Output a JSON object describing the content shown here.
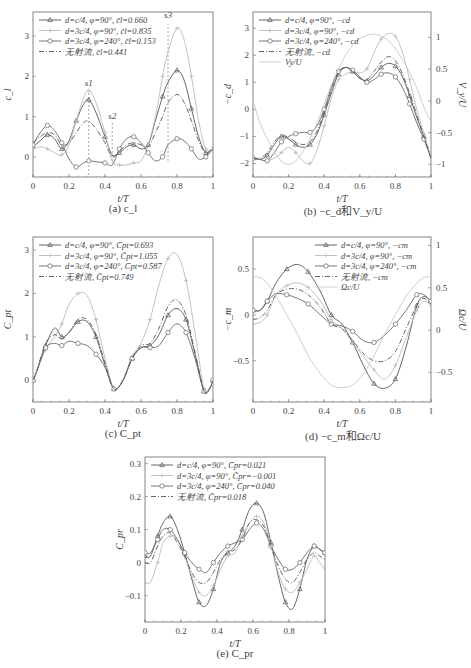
{
  "figure": {
    "captions": [
      "(a) c_l",
      "(b) −c_d和V_y/U",
      "(c) C_pt",
      "(d) −c_m和Ωc/U",
      "(e) C_pr"
    ]
  },
  "styles": {
    "A": {
      "color": "#555555",
      "dash": "",
      "marker": "triangle"
    },
    "B": {
      "color": "#bbbbbb",
      "dash": "",
      "marker": "plus"
    },
    "C": {
      "color": "#666666",
      "dash": "",
      "marker": "circle"
    },
    "D": {
      "color": "#555555",
      "dash": "5,2,1,2",
      "marker": "none"
    },
    "E": {
      "color": "#c8c8c8",
      "dash": "",
      "marker": "none"
    }
  },
  "chart_data": [
    {
      "id": "a",
      "type": "line",
      "caption": "(a) c_l",
      "box": {
        "x": 33,
        "y": 12,
        "w": 180,
        "h": 68
      },
      "xlabel": "t/T",
      "ylabel": "c_l",
      "xlim": [
        0,
        1
      ],
      "ylim": [
        -0.5,
        3.6
      ],
      "xticks": [
        0,
        0.2,
        0.4,
        0.6,
        0.8,
        1
      ],
      "yticks": [
        0,
        1,
        2,
        3
      ],
      "annotations": [
        {
          "text": "s1",
          "x": 0.31,
          "y": 1.75
        },
        {
          "text": "s2",
          "x": 0.44,
          "y": 0.95
        },
        {
          "text": "s3",
          "x": 0.75,
          "y": 3.45
        }
      ],
      "vlines": [
        {
          "x": 0.31,
          "y0": -0.45,
          "y1": 1.6
        },
        {
          "x": 0.44,
          "y0": -0.1,
          "y1": 0.85
        },
        {
          "x": 0.75,
          "y0": -0.1,
          "y1": 3.3
        }
      ],
      "legend": [
        {
          "style": "A",
          "label": "d=c/4, φ=90°, c̄l=0.660"
        },
        {
          "style": "B",
          "label": "d=3c/4, φ=90°, c̄l=0.835"
        },
        {
          "style": "C",
          "label": "d=3c/4, φ=240°, c̄l=0.153"
        },
        {
          "style": "D",
          "label": "无射流, c̄l=0.441"
        }
      ],
      "x": [
        0,
        0.04,
        0.08,
        0.12,
        0.16,
        0.2,
        0.24,
        0.28,
        0.31,
        0.35,
        0.4,
        0.44,
        0.48,
        0.52,
        0.56,
        0.6,
        0.64,
        0.68,
        0.72,
        0.75,
        0.8,
        0.84,
        0.88,
        0.92,
        0.96,
        1.0
      ],
      "series": [
        {
          "name": "d=c/4, φ=90°",
          "style": "A",
          "values": [
            0.25,
            0.4,
            0.55,
            0.45,
            0.2,
            0.4,
            0.9,
            1.3,
            1.42,
            1.1,
            0.5,
            0.05,
            0.1,
            0.25,
            0.3,
            0.2,
            0.3,
            0.9,
            1.5,
            1.85,
            2.15,
            1.9,
            1.2,
            0.5,
            0.1,
            0.2
          ]
        },
        {
          "name": "d=3c/4, φ=90°",
          "style": "B",
          "values": [
            0.2,
            0.25,
            0.2,
            0.1,
            0.05,
            0.3,
            0.9,
            1.45,
            1.65,
            1.35,
            0.6,
            -0.1,
            -0.2,
            -0.2,
            -0.15,
            -0.1,
            0.3,
            1.0,
            2.0,
            2.6,
            3.2,
            2.9,
            2.0,
            0.9,
            0.2,
            0.2
          ]
        },
        {
          "name": "d=3c/4, φ=240°",
          "style": "C",
          "values": [
            0.3,
            0.6,
            0.78,
            0.65,
            0.35,
            -0.05,
            -0.25,
            -0.15,
            -0.1,
            -0.12,
            -0.15,
            -0.2,
            0.2,
            0.45,
            0.5,
            0.35,
            0.1,
            -0.1,
            0.0,
            0.3,
            0.45,
            0.4,
            0.2,
            -0.05,
            0.0,
            0.2
          ]
        },
        {
          "name": "无射流",
          "style": "D",
          "values": [
            0.35,
            0.5,
            0.6,
            0.55,
            0.3,
            0.35,
            0.6,
            0.85,
            0.88,
            0.7,
            0.35,
            0.0,
            0.15,
            0.3,
            0.35,
            0.3,
            0.25,
            0.6,
            1.0,
            1.35,
            1.55,
            1.35,
            0.9,
            0.4,
            0.1,
            0.25
          ]
        }
      ]
    },
    {
      "id": "b",
      "type": "line",
      "caption": "(b) −c_d和V_y/U",
      "box": {
        "x": 253,
        "y": 12,
        "w": 178,
        "h": 68
      },
      "xlabel": "t/T",
      "ylabel": "−c_d",
      "y2label": "V_y/U",
      "xlim": [
        0,
        1
      ],
      "ylim": [
        -2.5,
        3.6
      ],
      "y2lim": [
        -1.2,
        1.4
      ],
      "xticks": [
        0,
        0.2,
        0.4,
        0.6,
        0.8,
        1
      ],
      "yticks": [
        -2,
        -1,
        0,
        1,
        2,
        3
      ],
      "y2ticks": [
        -1,
        -0.5,
        0,
        0.5,
        1
      ],
      "legend": [
        {
          "style": "A",
          "label": "d=c/4, φ=90°, −cd"
        },
        {
          "style": "B",
          "label": "d=3c/4, φ=90°, −cd"
        },
        {
          "style": "C",
          "label": "d=3c/4, φ=240°, −cd"
        },
        {
          "style": "D",
          "label": "无射流, −cd"
        },
        {
          "style": "E",
          "label": "Vy/U"
        }
      ],
      "x": [
        0,
        0.04,
        0.08,
        0.12,
        0.16,
        0.2,
        0.24,
        0.28,
        0.32,
        0.36,
        0.4,
        0.44,
        0.48,
        0.52,
        0.56,
        0.6,
        0.64,
        0.68,
        0.72,
        0.76,
        0.8,
        0.84,
        0.88,
        0.92,
        0.96,
        1.0
      ],
      "series": [
        {
          "name": "d=c/4, φ=90°",
          "style": "A",
          "values": [
            -1.8,
            -1.85,
            -1.7,
            -1.3,
            -1.0,
            -1.1,
            -1.3,
            -1.4,
            -1.3,
            -0.9,
            -0.2,
            0.6,
            1.3,
            1.55,
            1.4,
            1.15,
            1.05,
            1.25,
            1.55,
            1.7,
            1.6,
            1.2,
            0.5,
            -0.3,
            -1.0,
            -1.8
          ]
        },
        {
          "name": "d=3c/4, φ=90°",
          "style": "B",
          "values": [
            -1.8,
            -1.85,
            -1.9,
            -1.8,
            -1.6,
            -1.4,
            -1.6,
            -1.9,
            -2.0,
            -1.5,
            -0.6,
            0.4,
            1.1,
            1.3,
            1.4,
            1.35,
            1.5,
            2.1,
            2.6,
            2.8,
            2.7,
            2.1,
            1.1,
            0.0,
            -0.9,
            -1.8
          ]
        },
        {
          "name": "d=3c/4, φ=240°",
          "style": "C",
          "values": [
            -1.8,
            -1.85,
            -1.9,
            -1.6,
            -1.2,
            -1.0,
            -0.9,
            -0.85,
            -0.85,
            -0.6,
            0.0,
            0.8,
            1.4,
            1.55,
            1.45,
            1.2,
            1.0,
            1.1,
            1.3,
            1.35,
            1.2,
            0.8,
            0.2,
            -0.5,
            -1.1,
            -1.8
          ]
        },
        {
          "name": "无射流",
          "style": "D",
          "values": [
            -1.8,
            -1.8,
            -1.6,
            -1.2,
            -0.95,
            -1.05,
            -1.2,
            -1.3,
            -1.2,
            -0.8,
            -0.1,
            0.7,
            1.35,
            1.55,
            1.4,
            1.15,
            1.1,
            1.4,
            1.75,
            1.95,
            1.8,
            1.3,
            0.6,
            -0.2,
            -1.0,
            -1.8
          ]
        },
        {
          "name": "Vy/U",
          "style": "E",
          "axis": "y2",
          "values": [
            0.0,
            -0.35,
            -0.6,
            -0.8,
            -0.95,
            -1.0,
            -0.95,
            -0.8,
            -0.6,
            -0.35,
            -0.05,
            0.25,
            0.5,
            0.72,
            0.88,
            0.98,
            1.03,
            1.05,
            1.02,
            0.95,
            0.82,
            0.65,
            0.45,
            0.2,
            -0.1,
            -0.35
          ]
        }
      ]
    },
    {
      "id": "c",
      "type": "line",
      "caption": "(c) C_pt",
      "box": {
        "x": 33,
        "y": 237,
        "w": 180,
        "h": 68
      },
      "xlabel": "t/T",
      "ylabel": "C_pt",
      "xlim": [
        0,
        1
      ],
      "ylim": [
        -0.5,
        3.3
      ],
      "xticks": [
        0,
        0.2,
        0.4,
        0.6,
        0.8,
        1
      ],
      "yticks": [
        0,
        1,
        2,
        3
      ],
      "legend": [
        {
          "style": "A",
          "label": "d=c/4, φ=90°, C̄pt=0.693"
        },
        {
          "style": "B",
          "label": "d=3c/4, φ=90°, C̄pt=1.055"
        },
        {
          "style": "C",
          "label": "d=3c/4, φ=240°, C̄pt=0.587"
        },
        {
          "style": "D",
          "label": "无射流, C̄pt=0.749"
        }
      ],
      "x": [
        0,
        0.02,
        0.07,
        0.12,
        0.16,
        0.2,
        0.25,
        0.3,
        0.35,
        0.4,
        0.45,
        0.5,
        0.55,
        0.6,
        0.65,
        0.7,
        0.75,
        0.8,
        0.85,
        0.9,
        0.95,
        0.98,
        1.0
      ],
      "series": [
        {
          "name": "d=c/4, φ=90°",
          "style": "A",
          "values": [
            0.0,
            0.2,
            0.8,
            1.2,
            1.0,
            1.1,
            1.35,
            1.35,
            1.0,
            0.35,
            -0.2,
            0.0,
            0.5,
            0.75,
            0.8,
            1.05,
            1.5,
            1.65,
            1.4,
            0.6,
            -0.25,
            -0.2,
            0.0
          ]
        },
        {
          "name": "d=3c/4, φ=90°",
          "style": "B",
          "values": [
            0.0,
            0.2,
            0.7,
            1.0,
            1.3,
            1.75,
            2.0,
            1.95,
            1.4,
            0.5,
            -0.2,
            0.0,
            0.55,
            0.85,
            1.4,
            2.2,
            2.8,
            2.9,
            2.3,
            1.1,
            -0.2,
            -0.2,
            0.0
          ]
        },
        {
          "name": "d=3c/4, φ=240°",
          "style": "C",
          "values": [
            0.0,
            0.2,
            0.75,
            0.85,
            0.8,
            0.9,
            0.85,
            0.8,
            0.6,
            0.3,
            -0.2,
            0.0,
            0.5,
            0.75,
            0.75,
            0.8,
            1.1,
            1.3,
            1.1,
            0.5,
            -0.25,
            -0.2,
            0.0
          ]
        },
        {
          "name": "无射流",
          "style": "D",
          "values": [
            0.0,
            0.2,
            0.85,
            1.05,
            0.95,
            1.1,
            1.4,
            1.4,
            1.05,
            0.4,
            -0.2,
            0.0,
            0.5,
            0.8,
            0.85,
            1.2,
            1.7,
            1.85,
            1.5,
            0.65,
            -0.25,
            -0.2,
            0.0
          ]
        }
      ]
    },
    {
      "id": "d",
      "type": "line",
      "caption": "(d) −c_m和Ωc/U",
      "box": {
        "x": 253,
        "y": 237,
        "w": 178,
        "h": 68
      },
      "xlabel": "t/T",
      "ylabel": "−c_m",
      "y2label": "Ωc/U",
      "xlim": [
        0,
        1
      ],
      "ylim": [
        -0.95,
        0.85
      ],
      "y2lim": [
        -0.85,
        1.1
      ],
      "xticks": [
        0,
        0.2,
        0.4,
        0.6,
        0.8,
        1
      ],
      "yticks": [
        -0.5,
        0,
        0.5
      ],
      "y2ticks": [
        -0.5,
        0,
        0.5,
        1
      ],
      "legend": [
        {
          "style": "A",
          "label": "d=c/4, φ=90°, −cm"
        },
        {
          "style": "B",
          "label": "d=3c/4, φ=90°, −cm"
        },
        {
          "style": "C",
          "label": "d=3c/4, φ=240°, −cm"
        },
        {
          "style": "D",
          "label": "无射流, −cm"
        },
        {
          "style": "E",
          "label": "Ωc/U"
        }
      ],
      "x": [
        0,
        0.04,
        0.08,
        0.13,
        0.19,
        0.25,
        0.31,
        0.38,
        0.44,
        0.5,
        0.56,
        0.62,
        0.68,
        0.74,
        0.8,
        0.86,
        0.92,
        0.96,
        1.0
      ],
      "series": [
        {
          "name": "d=c/4, φ=90°",
          "style": "A",
          "values": [
            0.05,
            0.05,
            0.15,
            0.35,
            0.5,
            0.55,
            0.47,
            0.25,
            0.0,
            -0.1,
            -0.3,
            -0.55,
            -0.75,
            -0.8,
            -0.7,
            -0.35,
            0.1,
            0.2,
            0.15
          ]
        },
        {
          "name": "d=3c/4, φ=90°",
          "style": "B",
          "values": [
            -0.1,
            -0.08,
            0.0,
            0.22,
            0.32,
            0.35,
            0.3,
            0.15,
            -0.05,
            -0.15,
            -0.3,
            -0.45,
            -0.6,
            -0.7,
            -0.55,
            -0.25,
            0.05,
            0.15,
            0.1
          ]
        },
        {
          "name": "d=3c/4, φ=240°",
          "style": "C",
          "values": [
            0.05,
            0.05,
            0.15,
            0.23,
            0.22,
            0.18,
            0.12,
            0.0,
            -0.1,
            -0.12,
            -0.18,
            -0.28,
            -0.3,
            -0.22,
            -0.1,
            0.05,
            0.22,
            0.22,
            0.15
          ]
        },
        {
          "name": "无射流",
          "style": "D",
          "values": [
            -0.05,
            -0.03,
            0.05,
            0.22,
            0.28,
            0.28,
            0.22,
            0.08,
            -0.1,
            -0.15,
            -0.28,
            -0.42,
            -0.5,
            -0.5,
            -0.4,
            -0.15,
            0.1,
            0.18,
            0.12
          ]
        },
        {
          "name": "Ωc/U",
          "style": "E",
          "axis": "y2",
          "values": [
            0.63,
            0.62,
            0.55,
            0.4,
            0.18,
            -0.05,
            -0.3,
            -0.52,
            -0.65,
            -0.68,
            -0.65,
            -0.52,
            -0.3,
            -0.05,
            0.18,
            0.4,
            0.55,
            0.62,
            0.63
          ]
        }
      ]
    },
    {
      "id": "e",
      "type": "line",
      "caption": "(e) C_pr",
      "box": {
        "x": 145,
        "y": 457,
        "w": 180,
        "h": 68
      },
      "xlabel": "t/T",
      "ylabel": "C_pr",
      "xlim": [
        0,
        1
      ],
      "ylim": [
        -0.18,
        0.32
      ],
      "xticks": [
        0,
        0.2,
        0.4,
        0.6,
        0.8,
        1
      ],
      "yticks": [
        -0.1,
        0,
        0.1,
        0.2,
        0.3
      ],
      "legend": [
        {
          "style": "A",
          "label": "d=c/4, φ=90°, C̄pr=0.021"
        },
        {
          "style": "B",
          "label": "d=3c/4, φ=90°, C̄pr=−0.001"
        },
        {
          "style": "C",
          "label": "d=3c/4, φ=240°, C̄pr=0.040"
        },
        {
          "style": "D",
          "label": "无射流, C̄pr=0.018"
        }
      ],
      "x": [
        0,
        0.03,
        0.07,
        0.1,
        0.14,
        0.18,
        0.22,
        0.26,
        0.3,
        0.34,
        0.38,
        0.42,
        0.46,
        0.5,
        0.54,
        0.58,
        0.62,
        0.66,
        0.7,
        0.74,
        0.78,
        0.82,
        0.86,
        0.9,
        0.94,
        0.97,
        1.0
      ],
      "series": [
        {
          "name": "d=c/4, φ=90°",
          "style": "A",
          "values": [
            0.02,
            0.02,
            0.08,
            0.12,
            0.14,
            0.1,
            0.03,
            -0.05,
            -0.12,
            -0.13,
            -0.08,
            0.0,
            0.03,
            0.05,
            0.1,
            0.16,
            0.18,
            0.15,
            0.06,
            -0.04,
            -0.12,
            -0.14,
            -0.08,
            0.01,
            0.05,
            0.04,
            0.03
          ]
        },
        {
          "name": "d=3c/4, φ=90°",
          "style": "B",
          "values": [
            -0.06,
            -0.06,
            0.0,
            0.06,
            0.08,
            0.07,
            0.02,
            -0.04,
            -0.09,
            -0.1,
            -0.07,
            -0.02,
            0.02,
            0.03,
            0.08,
            0.12,
            0.14,
            0.12,
            0.05,
            -0.03,
            -0.08,
            -0.09,
            -0.06,
            -0.02,
            0.02,
            0.0,
            -0.02
          ]
        },
        {
          "name": "d=3c/4, φ=240°",
          "style": "C",
          "values": [
            0.03,
            0.03,
            0.07,
            0.1,
            0.1,
            0.07,
            0.03,
            0.0,
            -0.02,
            -0.03,
            0.0,
            0.03,
            0.05,
            0.06,
            0.07,
            0.1,
            0.12,
            0.1,
            0.05,
            0.01,
            -0.02,
            -0.02,
            0.0,
            0.03,
            0.05,
            0.04,
            0.03
          ]
        },
        {
          "name": "无射流",
          "style": "D",
          "values": [
            0.0,
            0.0,
            0.05,
            0.08,
            0.09,
            0.06,
            0.02,
            -0.03,
            -0.06,
            -0.06,
            -0.03,
            0.01,
            0.03,
            0.04,
            0.07,
            0.12,
            0.13,
            0.11,
            0.05,
            -0.01,
            -0.05,
            -0.06,
            -0.03,
            0.01,
            0.03,
            0.02,
            0.01
          ]
        }
      ]
    }
  ]
}
